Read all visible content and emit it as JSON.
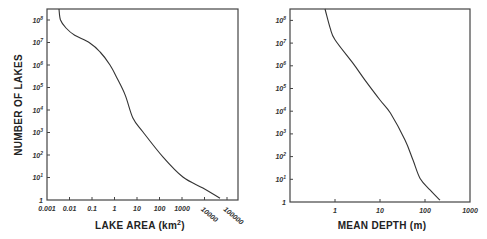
{
  "chart_data": [
    {
      "type": "line",
      "title": "",
      "xlabel": "LAKE AREA (km²)",
      "ylabel": "NUMBER OF LAKES",
      "xscale": "log",
      "yscale": "log",
      "xlim": [
        0.001,
        200000
      ],
      "ylim": [
        1,
        300000000
      ],
      "grid": false,
      "legend": null,
      "x_tick_labels": [
        "0.001",
        "0.01",
        "0.1",
        "1",
        "10",
        "100",
        "1000",
        "10000",
        "100000"
      ],
      "y_tick_labels": [
        "1",
        "10¹",
        "10²",
        "10³",
        "10⁴",
        "10⁵",
        "10⁶",
        "10⁷",
        "10⁸"
      ],
      "series": [
        {
          "name": "Number of lakes vs. lake area",
          "x": [
            0.0034,
            0.004,
            0.007,
            0.017,
            0.08,
            0.23,
            0.63,
            1.3,
            3,
            6.6,
            18.5,
            144,
            1100,
            8500,
            49000
          ],
          "y": [
            310000000,
            100000000,
            44000000,
            21000000,
            9500000,
            3800000,
            1000000,
            260000,
            46000,
            4400,
            1050,
            81,
            10.5,
            3.4,
            1.2
          ]
        }
      ]
    },
    {
      "type": "line",
      "title": "",
      "xlabel": "MEAN DEPTH (m)",
      "ylabel": "",
      "xscale": "log",
      "yscale": "log",
      "xlim": [
        0.1,
        1000
      ],
      "ylim": [
        1,
        300000000
      ],
      "grid": false,
      "legend": null,
      "x_tick_labels": [
        "1",
        "10",
        "100",
        "1000"
      ],
      "y_tick_labels": [
        "1",
        "10¹",
        "10²",
        "10³",
        "10⁴",
        "10⁵",
        "10⁶",
        "10⁷",
        "10⁸"
      ],
      "series": [
        {
          "name": "Number of lakes vs. mean depth",
          "x": [
            0.6,
            0.78,
            1,
            2.5,
            4.6,
            10,
            17,
            36,
            54,
            78,
            129,
            215
          ],
          "y": [
            320000000,
            47000000,
            14000000,
            1300000,
            240000,
            31000,
            8300,
            540,
            71,
            11,
            3.4,
            1.2
          ]
        }
      ]
    }
  ],
  "left_chart": {
    "ylabel": "NUMBER OF LAKES",
    "xlabel_main": "LAKE AREA (km",
    "xlabel_sup": "2",
    "xlabel_end": ")",
    "x_ticks": [
      "0.001",
      "0.01",
      "0.1",
      "1",
      "10",
      "100",
      "1000",
      "10000",
      "100000"
    ],
    "y_ticks": [
      {
        "base": "10",
        "exp": "8"
      },
      {
        "base": "10",
        "exp": "7"
      },
      {
        "base": "10",
        "exp": "6"
      },
      {
        "base": "10",
        "exp": "5"
      },
      {
        "base": "10",
        "exp": "4"
      },
      {
        "base": "10",
        "exp": "3"
      },
      {
        "base": "10",
        "exp": "2"
      },
      {
        "base": "10",
        "exp": "1"
      },
      {
        "base": "1",
        "exp": ""
      }
    ]
  },
  "right_chart": {
    "xlabel": "MEAN DEPTH (m)",
    "x_ticks": [
      "1",
      "10",
      "100",
      "1000"
    ],
    "y_ticks": [
      {
        "base": "10",
        "exp": "8"
      },
      {
        "base": "10",
        "exp": "7"
      },
      {
        "base": "10",
        "exp": "6"
      },
      {
        "base": "10",
        "exp": "5"
      },
      {
        "base": "10",
        "exp": "4"
      },
      {
        "base": "10",
        "exp": "3"
      },
      {
        "base": "10",
        "exp": "2"
      },
      {
        "base": "10",
        "exp": "1"
      },
      {
        "base": "1",
        "exp": ""
      }
    ]
  }
}
